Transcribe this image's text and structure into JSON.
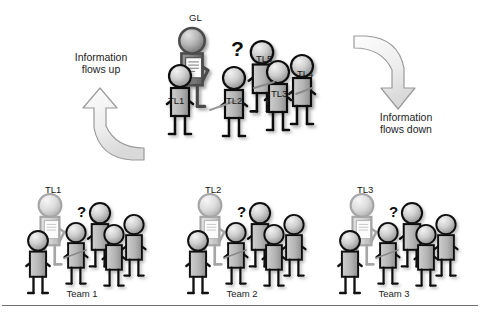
{
  "figure": {
    "type": "diagram",
    "background_color": "#ffffff",
    "title_present": false
  },
  "annotations": {
    "flow_up": {
      "line1": "Information",
      "line2": "flows up"
    },
    "flow_down": {
      "line1": "Information",
      "line2": "flows down"
    },
    "question_mark": "?"
  },
  "top_group": {
    "name": "group-leader-with-team-leaders",
    "leader": {
      "label": "GL",
      "role": "group-leader",
      "holds_document": true
    },
    "members": [
      {
        "label": "TL1"
      },
      {
        "label": "TL2"
      },
      {
        "label": "TL3"
      },
      {
        "label": "TL4"
      },
      {
        "label": "TL5"
      }
    ],
    "question_mark": "?"
  },
  "teams": [
    {
      "leader_label": "TL1",
      "caption": "Team 1",
      "question_mark": "?",
      "member_count": 4
    },
    {
      "leader_label": "TL2",
      "caption": "Team 2",
      "question_mark": "?",
      "member_count": 4
    },
    {
      "leader_label": "TL3",
      "caption": "Team 3",
      "question_mark": "?",
      "member_count": 4
    }
  ],
  "colors": {
    "background": "#ffffff",
    "figure_outline": "#111111",
    "figure_fill_light": "#d8d8d8",
    "figure_fill_mid": "#a8a8a8",
    "figure_fill_dark": "#6a6a6a",
    "arrow_fill": "#e9e9e9",
    "arrow_stroke": "#8c8c8c",
    "text": "#1b1b1b",
    "rule": "#6f6f6f"
  }
}
